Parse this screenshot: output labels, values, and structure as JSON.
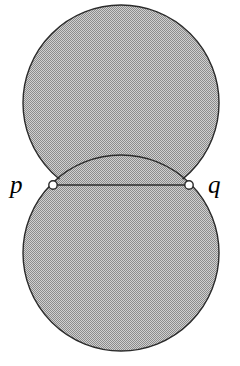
{
  "figure": {
    "type": "geometric-diagram",
    "canvas": {
      "width": 240,
      "height": 366,
      "background": "#ffffff"
    },
    "style": {
      "fill_pattern": "checkerboard-dither",
      "fill_color": "#a9a9a9",
      "fill_dark": "#8c8c8c",
      "fill_light": "#d0d0d0",
      "outline_color": "#2b2b2b",
      "outline_width": 1.4,
      "chord_color": "#2b2b2b",
      "chord_width": 1.6,
      "vertex_fill": "#ffffff",
      "vertex_stroke": "#2b2b2b"
    },
    "shapes": [
      {
        "name": "upper-disc",
        "kind": "circle",
        "cx": 121,
        "cy": 103,
        "r": 98
      },
      {
        "name": "lower-disc",
        "kind": "circle",
        "cx": 121,
        "cy": 253,
        "r": 98
      }
    ],
    "chord": {
      "name": "pinch-chord",
      "x1": 53,
      "y1": 185,
      "x2": 189,
      "y2": 185
    },
    "vertices": [
      {
        "name": "point-p",
        "label": "p",
        "cx": 53,
        "cy": 185,
        "r": 4.2
      },
      {
        "name": "point-q",
        "label": "q",
        "cx": 189,
        "cy": 185,
        "r": 4.2
      }
    ],
    "labels": {
      "p": "p",
      "q": "q"
    }
  }
}
